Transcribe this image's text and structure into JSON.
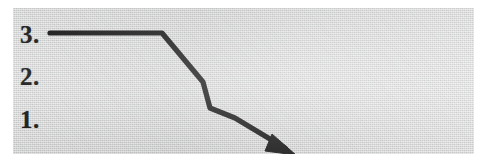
{
  "document": {
    "kind": "scanned-diagram",
    "background_color": "#cfd0d0",
    "page_color": "#ffffff",
    "ink_color": "#171717"
  },
  "labels": {
    "tier_3": "3.",
    "tier_2": "2.",
    "tier_1": "1."
  },
  "diagram": {
    "name": "descending-step-arrow",
    "stroke_color": "#171717",
    "stroke_width": "5.2",
    "path": "M 37 25 L 149 25 L 190 74 L 197 100 L 222 110 L 272 140",
    "arrowhead_points": "259,126 283,147 252,143"
  }
}
